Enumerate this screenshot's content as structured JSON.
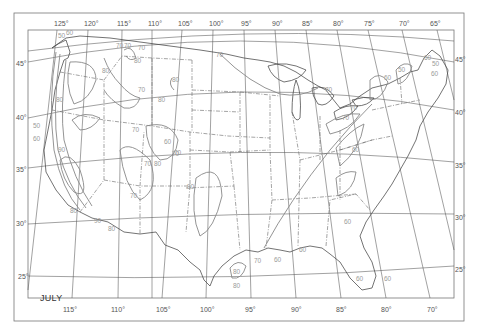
{
  "map": {
    "title": "JULY",
    "subject": "Contour map of the conterminous United States",
    "longitude_labels_top": [
      "125°",
      "120°",
      "115°",
      "110°",
      "105°",
      "100°",
      "95°",
      "90°",
      "85°",
      "80°",
      "75°",
      "70°",
      "65°"
    ],
    "longitude_labels_bottom": [
      "115°",
      "110°",
      "105°",
      "100°",
      "95°",
      "90°",
      "85°",
      "80°",
      "70°"
    ],
    "latitude_labels_left": [
      "45°",
      "40°",
      "35°",
      "30°",
      "25°"
    ],
    "latitude_labels_right": [
      "45°",
      "40°",
      "35°",
      "30°",
      "25°"
    ],
    "contour_labels": [
      {
        "value": "50",
        "region": "Pacific Northwest coast"
      },
      {
        "value": "60",
        "region": "Washington coast"
      },
      {
        "value": "70",
        "region": "Northern Idaho"
      },
      {
        "value": "70",
        "region": "Idaho panhandle"
      },
      {
        "value": "70",
        "region": "Western Montana"
      },
      {
        "value": "80",
        "region": "Western Montana"
      },
      {
        "value": "80",
        "region": "Central Montana"
      },
      {
        "value": "80",
        "region": "Eastern Oregon / Idaho"
      },
      {
        "value": "80",
        "region": "Western Wyoming"
      },
      {
        "value": "70",
        "region": "Wyoming / Idaho"
      },
      {
        "value": "70",
        "region": "Wyoming"
      },
      {
        "value": "70",
        "region": "Utah"
      },
      {
        "value": "80",
        "region": "Northern California interior"
      },
      {
        "value": "50",
        "region": "Northern California coast"
      },
      {
        "value": "60",
        "region": "Northern California coast"
      },
      {
        "value": "90",
        "region": "Central Valley California"
      },
      {
        "value": "80",
        "region": "Colorado"
      },
      {
        "value": "70",
        "region": "Colorado"
      },
      {
        "value": "70",
        "region": "Colorado south"
      },
      {
        "value": "60",
        "region": "Colorado Rockies"
      },
      {
        "value": "70",
        "region": "Arizona"
      },
      {
        "value": "80",
        "region": "Southern California"
      },
      {
        "value": "90",
        "region": "Southern California"
      },
      {
        "value": "80",
        "region": "Arizona south"
      },
      {
        "value": "80",
        "region": "Texas panhandle"
      },
      {
        "value": "70",
        "region": "North Dakota"
      },
      {
        "value": "70",
        "region": "Michigan"
      },
      {
        "value": "70",
        "region": "Ohio / Pennsylvania"
      },
      {
        "value": "70",
        "region": "Pennsylvania"
      },
      {
        "value": "60",
        "region": "New York"
      },
      {
        "value": "50",
        "region": "Vermont / New Hampshire"
      },
      {
        "value": "60",
        "region": "Maine"
      },
      {
        "value": "50",
        "region": "Maine"
      },
      {
        "value": "60",
        "region": "Maine coast"
      },
      {
        "value": "60",
        "region": "Virginia"
      },
      {
        "value": "60",
        "region": "Georgia / South Carolina"
      },
      {
        "value": "70",
        "region": "Texas coast"
      },
      {
        "value": "60",
        "region": "Louisiana"
      },
      {
        "value": "60",
        "region": "Mississippi coast"
      },
      {
        "value": "80",
        "region": "South Texas"
      },
      {
        "value": "80",
        "region": "South Texas"
      },
      {
        "value": "60",
        "region": "South Florida"
      },
      {
        "value": "60",
        "region": "South Florida"
      }
    ]
  }
}
